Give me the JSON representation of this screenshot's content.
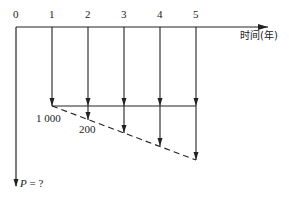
{
  "diagram": {
    "type": "cash-flow-diagram",
    "axis_label": "时间(年)",
    "periods": [
      "0",
      "1",
      "2",
      "3",
      "4",
      "5"
    ],
    "base_payment_label": "1 000",
    "gradient_label": "200",
    "present_value_label": "P = ?",
    "present_value_symbol": "P",
    "present_value_rest": " = ?",
    "cash_flows": [
      {
        "period": 1,
        "direction": "down",
        "amount": "1000"
      },
      {
        "period": 2,
        "direction": "down",
        "amount": "1000 + 200"
      },
      {
        "period": 3,
        "direction": "down",
        "amount": "1000 + 400"
      },
      {
        "period": 4,
        "direction": "down",
        "amount": "1000 + 600"
      },
      {
        "period": 5,
        "direction": "down",
        "amount": "1000 + 800"
      }
    ],
    "colors": {
      "line": "#222222",
      "background": "#ffffff"
    }
  }
}
